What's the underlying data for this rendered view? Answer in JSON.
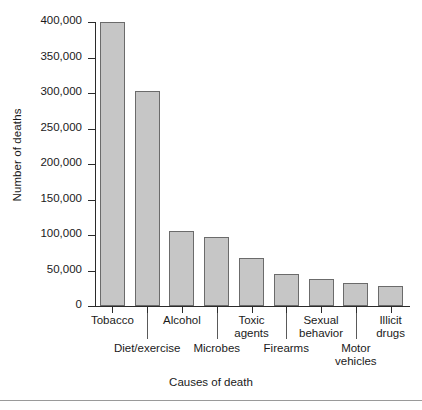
{
  "chart_data": {
    "type": "bar",
    "title": "",
    "xlabel": "Causes of death",
    "ylabel": "Number of deaths",
    "categories": [
      "Tobacco",
      "Diet/exercise",
      "Alcohol",
      "Microbes",
      "Toxic agents",
      "Firearms",
      "Sexual behavior",
      "Motor vehicles",
      "Illicit drugs"
    ],
    "values": [
      400000,
      303000,
      105000,
      97000,
      68000,
      45000,
      38000,
      32000,
      28000
    ],
    "ylim": [
      0,
      400000
    ],
    "ytick_values": [
      0,
      50000,
      100000,
      150000,
      200000,
      250000,
      300000,
      350000,
      400000
    ],
    "ytick_labels": [
      "0",
      "50,000",
      "100,000",
      "150,000",
      "200,000",
      "250,000",
      "300,000",
      "350,000",
      "400,000"
    ],
    "grid": false,
    "legend": null,
    "bar_color": "#c6c6c6",
    "bar_edge_color": "#6b6b6b",
    "axis_color": "#2b2b2b",
    "background": "#ffffff",
    "label_rows": [
      {
        "text": "Tobacco",
        "row": "top",
        "index": 0
      },
      {
        "text": "Diet/exercise",
        "row": "bottom",
        "index": 1
      },
      {
        "text": "Alcohol",
        "row": "top",
        "index": 2
      },
      {
        "text": "Microbes",
        "row": "bottom",
        "index": 3
      },
      {
        "text": "Toxic agents",
        "row": "top",
        "index": 4,
        "line1": "Toxic",
        "line2": "agents"
      },
      {
        "text": "Firearms",
        "row": "bottom",
        "index": 5
      },
      {
        "text": "Sexual behavior",
        "row": "top",
        "index": 6,
        "line1": "Sexual",
        "line2": "behavior"
      },
      {
        "text": "Motor vehicles",
        "row": "bottom",
        "index": 7,
        "line1": "Motor",
        "line2": "vehicles"
      },
      {
        "text": "Illicit drugs",
        "row": "top",
        "index": 8,
        "line1": "Illicit",
        "line2": "drugs"
      }
    ]
  }
}
